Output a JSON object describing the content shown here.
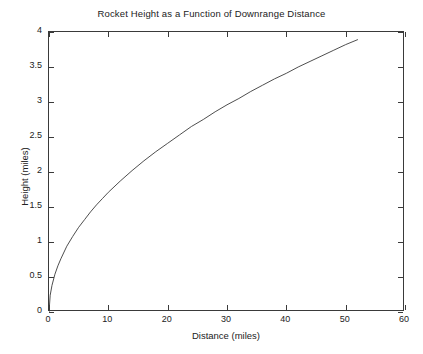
{
  "chart_data": {
    "type": "line",
    "title": "Rocket Height as a Function of Downrange Distance",
    "xlabel": "Distance (miles)",
    "ylabel": "Height (miles)",
    "xlim": [
      0,
      60
    ],
    "ylim": [
      0,
      4
    ],
    "grid": false,
    "legend": null,
    "xticks": [
      0,
      10,
      20,
      30,
      40,
      50,
      60
    ],
    "xticklabels": [
      "0",
      "10",
      "20",
      "30",
      "40",
      "50",
      "60"
    ],
    "yticks": [
      0,
      0.5,
      1,
      1.5,
      2,
      2.5,
      3,
      3.5,
      4
    ],
    "yticklabels": [
      "0",
      "0.5",
      "1",
      "1.5",
      "2",
      "2.5",
      "3",
      "3.5",
      "4"
    ],
    "line_color": "#3a3a3a",
    "line_width": 0.9,
    "series": [
      {
        "name": "Rocket trajectory",
        "x": [
          0,
          0.2,
          0.5,
          1,
          1.5,
          2,
          3,
          4,
          5,
          6,
          7,
          8,
          9,
          10,
          12,
          14,
          16,
          18,
          20,
          22,
          24,
          26,
          28,
          30,
          32,
          34,
          36,
          38,
          40,
          42,
          44,
          46,
          48,
          50,
          52
        ],
        "y": [
          0,
          0.24,
          0.38,
          0.54,
          0.66,
          0.76,
          0.94,
          1.08,
          1.21,
          1.32,
          1.43,
          1.53,
          1.62,
          1.71,
          1.87,
          2.02,
          2.16,
          2.29,
          2.41,
          2.53,
          2.65,
          2.75,
          2.86,
          2.96,
          3.05,
          3.15,
          3.24,
          3.33,
          3.41,
          3.5,
          3.58,
          3.66,
          3.74,
          3.82,
          3.89
        ]
      }
    ]
  }
}
